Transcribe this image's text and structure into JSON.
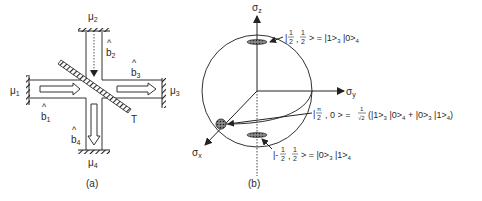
{
  "panel_a": {
    "caption": "(a)",
    "mirrors": {
      "mu1": {
        "base": "μ",
        "sub": "1"
      },
      "mu2": {
        "base": "μ",
        "sub": "2"
      },
      "mu3": {
        "base": "μ",
        "sub": "3"
      },
      "mu4": {
        "base": "μ",
        "sub": "4"
      }
    },
    "modes": {
      "b1": {
        "base": "b",
        "hat": "^",
        "sub": "1"
      },
      "b2": {
        "base": "b",
        "hat": "^",
        "sub": "2"
      },
      "b3": {
        "base": "b",
        "hat": "^",
        "sub": "3"
      },
      "b4": {
        "base": "b",
        "hat": "^",
        "sub": "4"
      }
    },
    "beam_splitter_label": "T"
  },
  "panel_b": {
    "caption": "(b)",
    "axes": {
      "z": {
        "base": "σ",
        "sub": "z"
      },
      "y": {
        "base": "σ",
        "sub": "y"
      },
      "x": {
        "base": "σ",
        "sub": "x"
      }
    },
    "states": {
      "top": {
        "ket_open": "|",
        "frac1_num": "1",
        "frac1_den": "2",
        "sep": ",",
        "frac2_num": "1",
        "frac2_den": "2",
        "rhs": "> = |1>",
        "rhs_sub1": "3",
        "rhs_mid": " |0>",
        "rhs_sub2": "4"
      },
      "equator": {
        "ket_open": "|",
        "frac_num": "π",
        "frac_den": "2",
        "mid": ", 0 > =",
        "coef_num": "1",
        "coef_den": "√2",
        "term1": "(|1>",
        "t1_sub": "3",
        "term2": " |0>",
        "t2_sub": "4",
        "plus": " + |0>",
        "t3_sub": "3",
        "term4": " |1>",
        "t4_sub": "4",
        "close": ")"
      },
      "bottom": {
        "ket_open": "|-",
        "frac1_num": "1",
        "frac1_den": "2",
        "sep": ",",
        "frac2_num": "1",
        "frac2_den": "2",
        "rhs": "> = |0>",
        "rhs_sub1": "3",
        "rhs_mid": " |1>",
        "rhs_sub2": "4"
      }
    }
  }
}
